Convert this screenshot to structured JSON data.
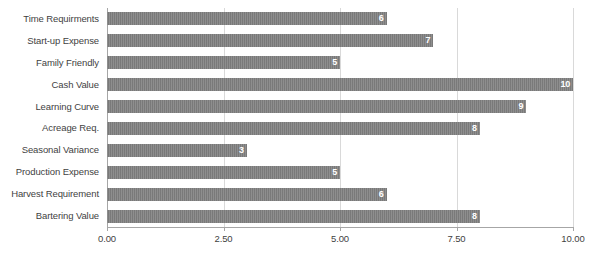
{
  "chart_data": {
    "type": "bar",
    "orientation": "horizontal",
    "title": "",
    "xlabel": "",
    "ylabel": "",
    "xlim": [
      0,
      10
    ],
    "grid": true,
    "legend": false,
    "legend_position": "none",
    "bar_color": "#808080",
    "value_label_color": "#ffffff",
    "axis_text_color": "#3f3f3f",
    "gridline_color": "#d9d9d9",
    "categories": [
      "Time Requirments",
      "Start-up Expense",
      "Family Friendly",
      "Cash Value",
      "Learning Curve",
      "Acreage Req.",
      "Seasonal Variance",
      "Production Expense",
      "Harvest Requirement",
      "Bartering Value"
    ],
    "values": [
      6,
      7,
      5,
      10,
      9,
      8,
      3,
      5,
      6,
      8
    ],
    "value_labels": [
      "6",
      "7",
      "5",
      "10",
      "9",
      "8",
      "3",
      "5",
      "6",
      "8"
    ],
    "xticks": [
      0,
      2.5,
      5,
      7.5,
      10
    ],
    "xtick_labels": [
      "0.00",
      "2.50",
      "5.00",
      "7.50",
      "10.00"
    ]
  }
}
